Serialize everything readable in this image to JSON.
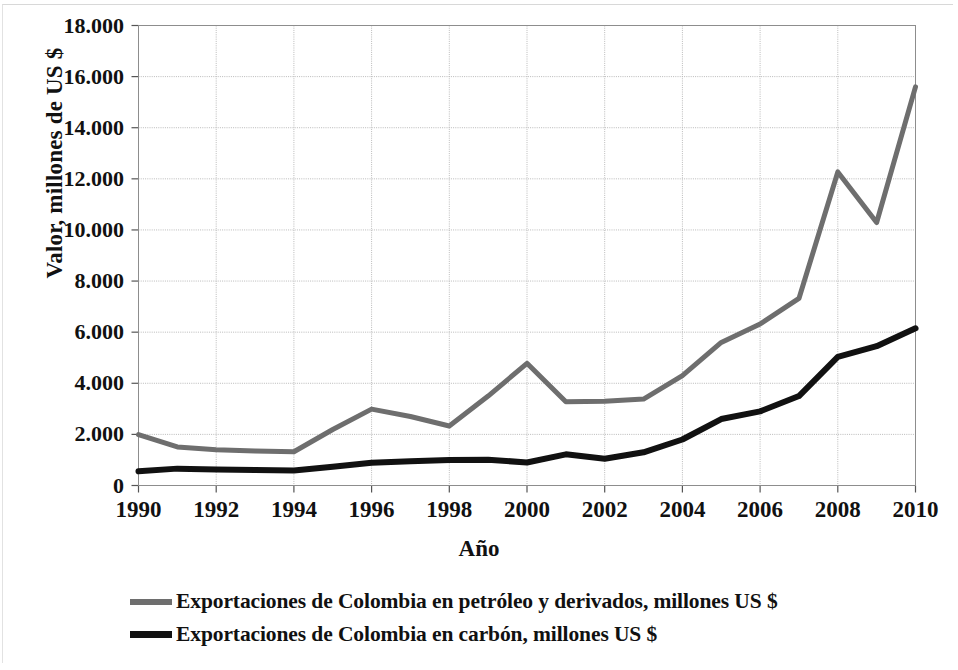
{
  "chart_data": {
    "type": "line",
    "title": "",
    "xlabel": "Año",
    "ylabel": "Valor, millones de US $",
    "x": [
      1990,
      1991,
      1992,
      1993,
      1994,
      1995,
      1996,
      1997,
      1998,
      1999,
      2000,
      2001,
      2002,
      2003,
      2004,
      2005,
      2006,
      2007,
      2008,
      2009,
      2010
    ],
    "xtick_labels": [
      "1990",
      "1992",
      "1994",
      "1996",
      "1998",
      "2000",
      "2002",
      "2004",
      "2006",
      "2008",
      "2010"
    ],
    "xtick_values": [
      1990,
      1992,
      1994,
      1996,
      1998,
      2000,
      2002,
      2004,
      2006,
      2008,
      2010
    ],
    "ytick_labels": [
      "18.000",
      "16.000",
      "14.000",
      "12.000",
      "10.000",
      "8.000",
      "6.000",
      "4.000",
      "2.000",
      "0"
    ],
    "ytick_values": [
      18000,
      16000,
      14000,
      12000,
      10000,
      8000,
      6000,
      4000,
      2000,
      0
    ],
    "xlim": [
      1990,
      2010
    ],
    "ylim": [
      0,
      18000
    ],
    "grid": true,
    "legend_position": "bottom",
    "series": [
      {
        "name": "Exportaciones de Colombia en petróleo y derivados, millones US $",
        "color": "#6e6e6e",
        "width": 5,
        "values": [
          1990,
          1510,
          1400,
          1350,
          1320,
          2190,
          2990,
          2700,
          2330,
          3500,
          4780,
          3280,
          3300,
          3380,
          4300,
          5600,
          6320,
          7320,
          12270,
          10290,
          15600
        ]
      },
      {
        "name": "Exportaciones de Colombia en carbón, millones US $",
        "color": "#111111",
        "width": 6,
        "values": [
          560,
          660,
          630,
          610,
          590,
          730,
          890,
          950,
          1000,
          1010,
          900,
          1220,
          1050,
          1300,
          1800,
          2600,
          2900,
          3500,
          5030,
          5450,
          6150
        ]
      }
    ]
  },
  "axes": {
    "x_title": "Año",
    "y_title": "Valor, millones de US $"
  },
  "legend": {
    "items": [
      {
        "label": "Exportaciones de Colombia en petróleo y derivados, millones US $",
        "color": "#6e6e6e",
        "style": "medium"
      },
      {
        "label": "Exportaciones de Colombia en carbón, millones US $",
        "color": "#111111",
        "style": "thick"
      }
    ]
  },
  "colors": {
    "petroleo": "#6e6e6e",
    "carbon": "#111111",
    "grid": "#b9b9b9",
    "axis": "#6a6a6a",
    "background": "#ffffff"
  }
}
